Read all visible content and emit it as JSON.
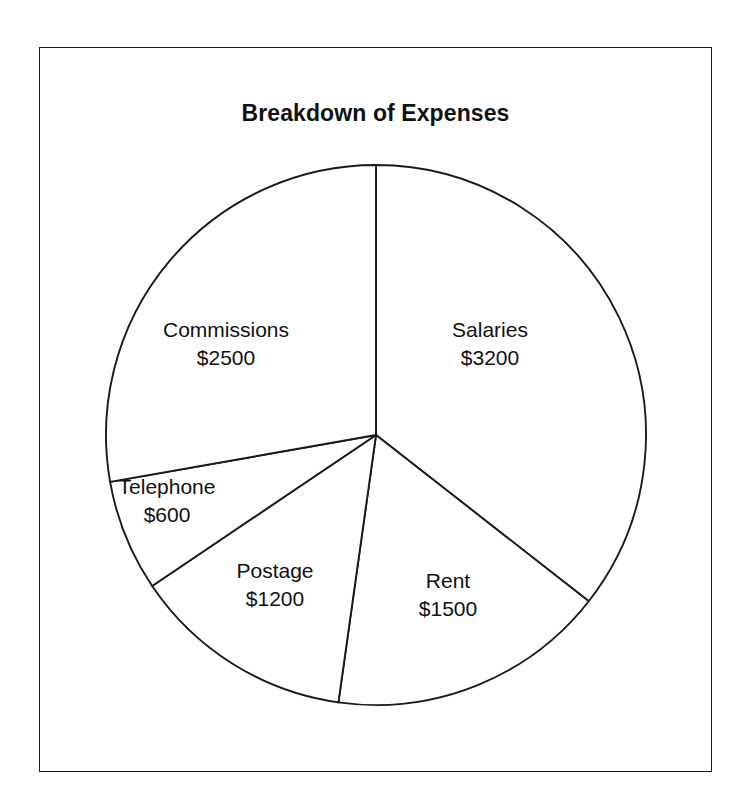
{
  "chart_data": {
    "type": "pie",
    "title": "Breakdown of Expenses",
    "xlabel": "",
    "ylabel": "",
    "units": "USD",
    "total": 9000,
    "legend_position": "none",
    "grid": false,
    "labels_inside_slices": true,
    "start_angle_deg": 0,
    "direction": "clockwise",
    "categories": [
      "Salaries",
      "Rent",
      "Postage",
      "Telephone",
      "Commissions"
    ],
    "values": [
      3200,
      1500,
      1200,
      600,
      2500
    ],
    "slices": [
      {
        "name": "Salaries",
        "value": 3200,
        "value_label": "$3200",
        "percent": 35.6,
        "angle_deg": 128,
        "start_deg": 0,
        "end_deg": 128,
        "label_x": 489,
        "label_y": 343
      },
      {
        "name": "Rent",
        "value": 1500,
        "value_label": "$1500",
        "percent": 16.7,
        "angle_deg": 60,
        "start_deg": 128,
        "end_deg": 188,
        "label_x": 447,
        "label_y": 594
      },
      {
        "name": "Postage",
        "value": 1200,
        "value_label": "$1200",
        "percent": 13.3,
        "angle_deg": 48,
        "start_deg": 188,
        "end_deg": 236,
        "label_x": 274,
        "label_y": 584
      },
      {
        "name": "Telephone",
        "value": 600,
        "value_label": "$600",
        "percent": 6.7,
        "angle_deg": 24,
        "start_deg": 236,
        "end_deg": 260,
        "label_x": 166,
        "label_y": 500
      },
      {
        "name": "Commissions",
        "value": 2500,
        "value_label": "$2500",
        "percent": 27.8,
        "angle_deg": 100,
        "start_deg": 260,
        "end_deg": 360,
        "label_x": 225,
        "label_y": 343
      }
    ],
    "geometry": {
      "center_x": 375,
      "center_y": 434,
      "radius": 270
    },
    "colors": {
      "slice_fill": "#ffffff",
      "outline": "#1a1a1a",
      "text": "#111111",
      "background": "#ffffff",
      "frame": "#1a1a1a"
    }
  }
}
